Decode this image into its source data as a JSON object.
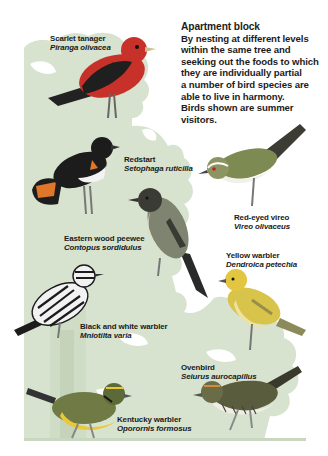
{
  "intro": {
    "title": "Apartment block",
    "lines": [
      "By nesting at different levels",
      "within the same tree and",
      "seeking out the foods to which",
      "they are individually partial",
      "a number of bird species are",
      "able to live in harmony.",
      "Birds shown are summer visitors."
    ]
  },
  "birds": [
    {
      "common": "Scarlet tanager",
      "latin": "Piranga olivacea"
    },
    {
      "common": "Redstart",
      "latin": "Setophaga ruticilla"
    },
    {
      "common": "Red-eyed vireo",
      "latin": "Vireo olivaceus"
    },
    {
      "common": "Eastern wood peewee",
      "latin": "Contopus sordidulus"
    },
    {
      "common": "Yellow warbler",
      "latin": "Dendroica petechia"
    },
    {
      "common": "Black and white warbler",
      "latin": "Mniotilta varia"
    },
    {
      "common": "Ovenbird",
      "latin": "Seiurus aurocapillus"
    },
    {
      "common": "Kentucky warbler",
      "latin": "Oporornis formosus"
    }
  ],
  "colors": {
    "tree": "#d7e3cf",
    "trunk": "#cfdcc6",
    "ground": "#c9d6c0",
    "tanager_red": "#c8302a",
    "tanager_wing": "#1f1f1f",
    "redstart_orange": "#e0762a",
    "yellow_warbler": "#e2c640",
    "kentucky_yellow": "#e8c93a",
    "olive": "#7d8a52"
  }
}
